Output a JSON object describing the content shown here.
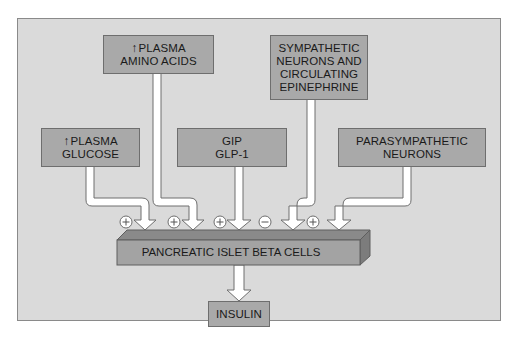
{
  "diagram": {
    "inputs": [
      {
        "id": "glucose",
        "lines": [
          "PLASMA",
          "GLUCOSE"
        ],
        "prefix_icon": "up-arrow",
        "effect": "+"
      },
      {
        "id": "amino-acids",
        "lines": [
          "PLASMA",
          "AMINO ACIDS"
        ],
        "prefix_icon": "up-arrow",
        "effect": "+"
      },
      {
        "id": "gip-glp1",
        "lines": [
          "GIP",
          "GLP-1"
        ],
        "effect": "+"
      },
      {
        "id": "sympathetic",
        "lines": [
          "SYMPATHETIC",
          "NEURONS AND",
          "CIRCULATING",
          "EPINEPHRINE"
        ],
        "effect": "−"
      },
      {
        "id": "parasympathetic",
        "lines": [
          "PARASYMPATHETIC",
          "NEURONS"
        ],
        "effect": "+"
      }
    ],
    "effects": [
      "+",
      "+",
      "+",
      "−",
      "+"
    ],
    "target": {
      "label": "PANCREATIC ISLET BETA CELLS"
    },
    "output": {
      "label": "INSULIN"
    },
    "up_arrow_glyph": "↑",
    "colors": {
      "panel": "#dadada",
      "box": "#a9a9a9",
      "bar_front": "#a0a0a0",
      "bar_top": "#808080",
      "arrow": "#ffffff"
    }
  }
}
